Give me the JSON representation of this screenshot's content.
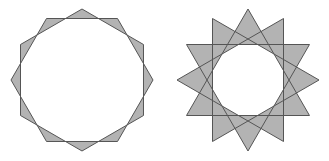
{
  "figures": [
    {
      "id": "star-12-2",
      "label": "Dodecagram formed by two overlapping hexagons",
      "cx": 82,
      "cy": 80,
      "r": 71,
      "n": 12,
      "step": 2
    },
    {
      "id": "star-12-4",
      "label": "Dodecagram formed by four overlapping triangles",
      "cx": 248,
      "cy": 80,
      "r": 71,
      "n": 12,
      "step": 4
    }
  ],
  "colors": {
    "fill": "#b3b3b3",
    "stroke": "#555555",
    "inner": "#ffffff",
    "background": "#ffffff"
  }
}
